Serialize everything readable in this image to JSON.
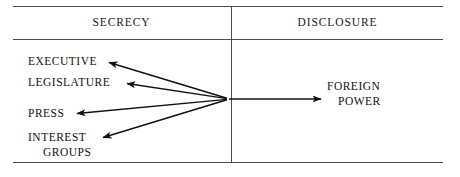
{
  "diagram": {
    "title_left": "SECRECY",
    "title_right": "DISCLOSURE",
    "columns": [
      {
        "header": "SECRECY"
      },
      {
        "header": "DISCLOSURE"
      }
    ],
    "source_nodes": [
      {
        "id": "executive",
        "label": "EXECUTIVE"
      },
      {
        "id": "legislature",
        "label": "LEGISLATURE"
      },
      {
        "id": "press",
        "label": "PRESS"
      },
      {
        "id": "interest_groups",
        "label_line1": "INTEREST",
        "label_line2": "GROUPS"
      }
    ],
    "target_node": {
      "id": "foreign_power",
      "label_line1": "FOREIGN",
      "label_line2": "POWER"
    },
    "hub": {
      "x": 228,
      "y": 99
    },
    "edges": [
      {
        "from": "hub",
        "to": "executive",
        "direction": "left",
        "arrowhead": "to"
      },
      {
        "from": "hub",
        "to": "legislature",
        "direction": "left",
        "arrowhead": "to"
      },
      {
        "from": "hub",
        "to": "press",
        "direction": "left",
        "arrowhead": "to"
      },
      {
        "from": "hub",
        "to": "interest_groups",
        "direction": "left",
        "arrowhead": "to"
      },
      {
        "from": "hub",
        "to": "foreign_power",
        "direction": "right",
        "arrowhead": "to"
      }
    ],
    "colors": {
      "line": "#4d4d4d",
      "arrow": "#111111",
      "text": "#111111",
      "background": "#ffffff"
    }
  }
}
